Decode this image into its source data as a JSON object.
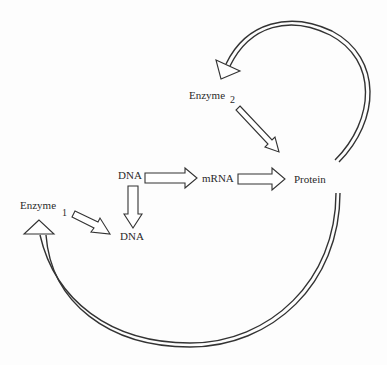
{
  "diagram": {
    "nodes": {
      "dna_top": "DNA",
      "mrna": "mRNA",
      "protein": "Protein",
      "dna_bottom": "DNA",
      "enzyme1": "Enzyme",
      "enzyme1_sub": "1",
      "enzyme2": "Enzyme",
      "enzyme2_sub": "2"
    },
    "edges": [
      {
        "from": "DNA",
        "to": "mRNA",
        "style": "block-arrow"
      },
      {
        "from": "mRNA",
        "to": "Protein",
        "style": "block-arrow"
      },
      {
        "from": "DNA",
        "to": "DNA",
        "style": "block-arrow",
        "direction": "down"
      },
      {
        "from": "Enzyme 1",
        "to": "DNA",
        "style": "block-arrow"
      },
      {
        "from": "Enzyme 2",
        "to": "Protein",
        "style": "block-arrow"
      },
      {
        "from": "Protein",
        "to": "Enzyme 2",
        "style": "double-line-arc"
      },
      {
        "from": "Protein",
        "to": "Enzyme 1",
        "style": "double-line-arc"
      }
    ],
    "colors": {
      "line": "#333333",
      "text": "#2a2a2a",
      "background": "#fdfdfd"
    }
  }
}
